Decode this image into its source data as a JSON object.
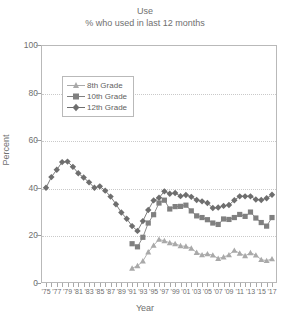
{
  "chart_data": {
    "type": "line",
    "title": "Use",
    "subtitle": "% who used in last 12 months",
    "xlabel": "Year",
    "ylabel": "Percent",
    "ylim": [
      0,
      100
    ],
    "yticks": [
      0,
      20,
      40,
      60,
      80,
      100
    ],
    "xlim": [
      1975,
      2017
    ],
    "grid": true,
    "legend_position": "upper-left-inside",
    "xtick_labels": [
      "'75",
      "'77",
      "'79",
      "'81",
      "'83",
      "'85",
      "'87",
      "'89",
      "'91",
      "'93",
      "'95",
      "'97",
      "'99",
      "'01",
      "'03",
      "'05",
      "'07",
      "'09",
      "'11",
      "'13",
      "'15",
      "'17"
    ],
    "x": [
      1975,
      1976,
      1977,
      1978,
      1979,
      1980,
      1981,
      1982,
      1983,
      1984,
      1985,
      1986,
      1987,
      1988,
      1989,
      1990,
      1991,
      1992,
      1993,
      1994,
      1995,
      1996,
      1997,
      1998,
      1999,
      2000,
      2001,
      2002,
      2003,
      2004,
      2005,
      2006,
      2007,
      2008,
      2009,
      2010,
      2011,
      2012,
      2013,
      2014,
      2015,
      2016,
      2017
    ],
    "series": [
      {
        "name": "8th Grade",
        "marker": "triangle",
        "color": "#a9a9a9",
        "start_year": 1991,
        "values": [
          null,
          null,
          null,
          null,
          null,
          null,
          null,
          null,
          null,
          null,
          null,
          null,
          null,
          null,
          null,
          null,
          6.2,
          7.2,
          9.2,
          13.0,
          15.8,
          18.3,
          17.7,
          16.9,
          16.5,
          15.6,
          15.4,
          14.6,
          12.8,
          11.8,
          12.2,
          11.7,
          10.3,
          10.9,
          11.8,
          13.7,
          12.5,
          11.4,
          12.7,
          11.7,
          9.8,
          9.4,
          10.1
        ]
      },
      {
        "name": "10th Grade",
        "marker": "square",
        "color": "#808080",
        "start_year": 1991,
        "values": [
          null,
          null,
          null,
          null,
          null,
          null,
          null,
          null,
          null,
          null,
          null,
          null,
          null,
          null,
          null,
          null,
          16.5,
          15.2,
          19.2,
          25.2,
          28.7,
          33.6,
          34.8,
          31.1,
          32.1,
          32.2,
          32.7,
          30.3,
          28.2,
          27.5,
          26.6,
          25.2,
          24.6,
          26.9,
          26.7,
          27.5,
          28.8,
          28.0,
          29.8,
          27.3,
          25.4,
          23.9,
          27.5
        ]
      },
      {
        "name": "12th Grade",
        "marker": "diamond",
        "color": "#6e6e6e",
        "start_year": 1975,
        "values": [
          40.0,
          44.5,
          47.6,
          50.8,
          51.0,
          48.8,
          46.1,
          44.3,
          42.3,
          40.0,
          40.6,
          38.8,
          36.3,
          33.1,
          29.6,
          27.0,
          23.9,
          21.9,
          26.0,
          30.7,
          34.7,
          35.8,
          38.5,
          37.5,
          37.8,
          36.5,
          37.0,
          36.2,
          34.9,
          34.3,
          33.6,
          31.5,
          31.7,
          32.4,
          32.8,
          34.8,
          36.4,
          36.4,
          36.4,
          35.1,
          34.9,
          35.6,
          37.1
        ]
      }
    ]
  },
  "legend": {
    "items": [
      {
        "label": "8th Grade"
      },
      {
        "label": "10th Grade"
      },
      {
        "label": "12th Grade"
      }
    ]
  }
}
